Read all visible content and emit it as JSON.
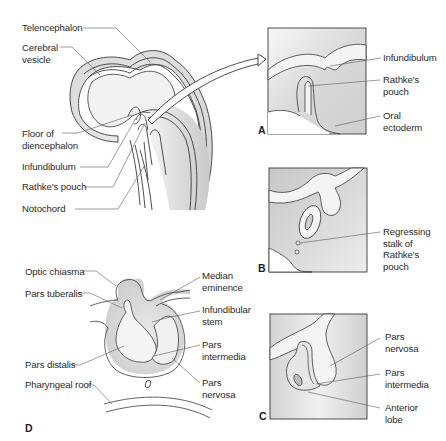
{
  "figure": {
    "colors": {
      "line": "#3a3a3a",
      "leader": "#5a5a5a",
      "tissue_shade": "#d6d6d6",
      "tissue_light": "#efefef",
      "box_fill": "#e2e2e2",
      "background": "#ffffff"
    }
  },
  "panels": {
    "overview": {
      "labels": [
        {
          "id": "telencephalon",
          "text": "Telencephalon"
        },
        {
          "id": "cerebral-vesicle",
          "text": "Cerebral\nvesicle"
        },
        {
          "id": "floor-of-diencephalon",
          "text": "Floor of\ndiencephalon"
        },
        {
          "id": "infundibulum",
          "text": "Infundibulum"
        },
        {
          "id": "rathkes-pouch",
          "text": "Rathke's pouch"
        },
        {
          "id": "notochord",
          "text": "Notochord"
        }
      ]
    },
    "A": {
      "letter": "A",
      "labels": [
        {
          "id": "infundibulum",
          "text": "Infundibulum"
        },
        {
          "id": "rathkes-pouch",
          "text": "Rathke's\npouch"
        },
        {
          "id": "oral-ectoderm",
          "text": "Oral\nectoderm"
        }
      ]
    },
    "B": {
      "letter": "B",
      "labels": [
        {
          "id": "regressing-stalk",
          "text": "Regressing\nstalk of\nRathke's\npouch"
        }
      ]
    },
    "C": {
      "letter": "C",
      "labels": [
        {
          "id": "pars-nervosa",
          "text": "Pars\nnervosa"
        },
        {
          "id": "pars-intermedia",
          "text": "Pars\nintermedia"
        },
        {
          "id": "anterior-lobe",
          "text": "Anterior\nlobe"
        }
      ]
    },
    "D": {
      "letter": "D",
      "labels": [
        {
          "id": "optic-chiasma",
          "text": "Optic chiasma"
        },
        {
          "id": "pars-tuberalis",
          "text": "Pars tuberalis"
        },
        {
          "id": "pars-distalis",
          "text": "Pars distalis"
        },
        {
          "id": "pharyngeal-roof",
          "text": "Pharyngeal roof"
        },
        {
          "id": "median-eminence",
          "text": "Median\neminence"
        },
        {
          "id": "infundibular-stem",
          "text": "Infundibular\nstem"
        },
        {
          "id": "pars-intermedia",
          "text": "Pars\nintermedia"
        },
        {
          "id": "pars-nervosa",
          "text": "Pars\nnervosa"
        }
      ]
    }
  }
}
